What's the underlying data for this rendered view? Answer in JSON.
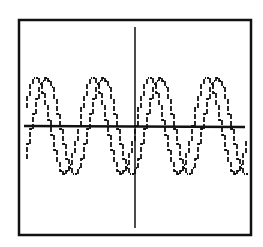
{
  "screen": {
    "description": "Graphing calculator display",
    "colors": {
      "background": "#ffffff",
      "ink": "#111111"
    }
  },
  "chart_data": {
    "type": "line",
    "title": "",
    "xlabel": "",
    "ylabel": "",
    "grid": false,
    "legend": null,
    "axes": {
      "x_axis_pixel_y": 126,
      "y_axis_pixel_x": 135,
      "xlim_pixels": [
        18,
        251
      ],
      "ylim_pixels": [
        19,
        235
      ]
    },
    "series": [
      {
        "name": "y1 = sin(x)",
        "amplitude_px": 48,
        "period_px": 57,
        "phase_px": 0,
        "peaks_x_px": [
          35,
          92,
          148,
          205
        ]
      },
      {
        "name": "y2 = sin(x - shift)",
        "amplitude_px": 48,
        "period_px": 57,
        "phase_px": 10,
        "peaks_x_px": [
          45,
          102,
          158,
          215
        ]
      }
    ],
    "annotations": [
      "pixelated calculator-style rendering",
      "two phase-shifted sine curves"
    ]
  }
}
